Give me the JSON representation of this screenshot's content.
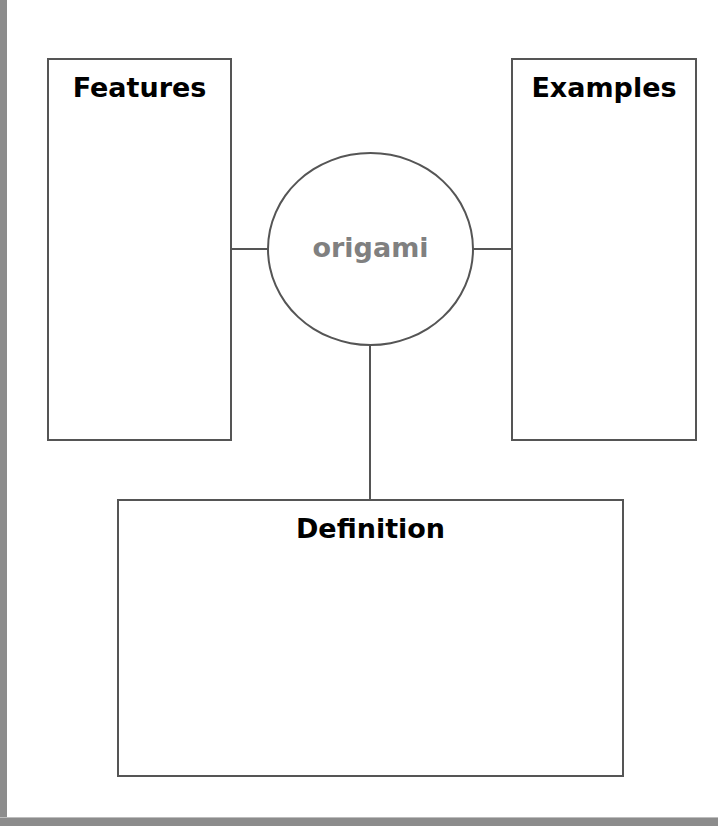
{
  "diagram": {
    "type": "concept map (Frayer-style)",
    "center": {
      "label": "origami",
      "color": "#808080"
    },
    "boxes": {
      "features": {
        "title": "Features"
      },
      "examples": {
        "title": "Examples"
      },
      "definition": {
        "title": "Definition"
      }
    },
    "colors": {
      "stroke": "#555555",
      "title_text": "#000000",
      "frame": "#8c8c8c"
    }
  }
}
